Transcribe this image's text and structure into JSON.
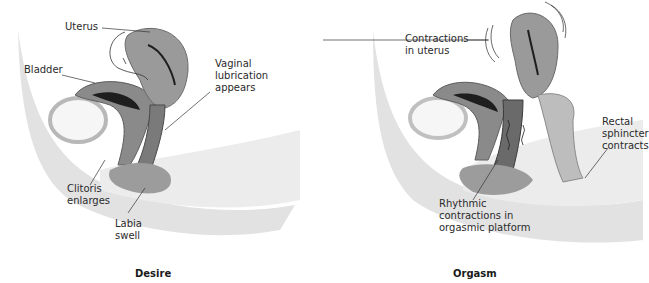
{
  "panels": [
    {
      "caption": "Desire",
      "labels": {
        "uterus": "Uterus",
        "bladder": "Bladder",
        "vaginal_lubrication": "Vaginal\nlubrication\nappears",
        "clitoris": "Clitoris\nenlarges",
        "labia": "Labia\nswell"
      }
    },
    {
      "caption": "Orgasm",
      "labels": {
        "contractions_uterus": "Contractions\nin uterus",
        "rectal_sphincter": "Rectal\nsphincter\ncontracts",
        "rhythmic": "Rhythmic\ncontractions in\norgasmic platform"
      }
    }
  ],
  "colors": {
    "tissue_light": "#e4e4e4",
    "tissue_mid": "#a8a8a8",
    "tissue_dark": "#6e6e6e",
    "cavity": "#1e1e1e",
    "leader": "#333333"
  }
}
